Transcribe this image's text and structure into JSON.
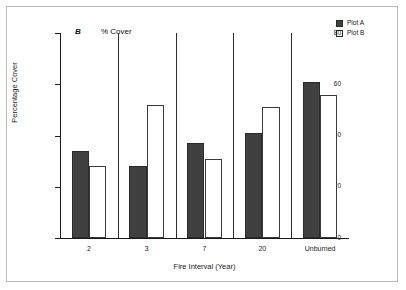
{
  "chart_data": {
    "type": "bar",
    "title": "",
    "panel_label": "B",
    "subtitle": "% Cover",
    "xlabel": "Fire Interval (Year)",
    "ylabel": "Percentage Cover",
    "categories": [
      "2",
      "3",
      "7",
      "20",
      "Unburned"
    ],
    "series": [
      {
        "name": "Plot A",
        "color": "#404040",
        "values": [
          34,
          28,
          37,
          41,
          61
        ]
      },
      {
        "name": "Plot B",
        "color": "#ffffff",
        "values": [
          28,
          52,
          31,
          51,
          56
        ]
      }
    ],
    "ylim": [
      0,
      80
    ],
    "yticks": [
      0,
      20,
      40,
      60,
      80
    ],
    "ytick_labels": [
      "0",
      "20",
      "40",
      "60",
      "80"
    ],
    "grid": false,
    "legend_position": "top-right"
  },
  "legend": {
    "items": [
      {
        "label": "Plot A",
        "style": "filled"
      },
      {
        "label": "Plot B",
        "style": "open"
      }
    ]
  },
  "axes": {
    "y_title": "Percentage Cover",
    "x_title": "Fire Interval (Year)",
    "y_tick_0": "0",
    "y_tick_1": "20",
    "y_tick_2": "40",
    "y_tick_3": "60",
    "y_tick_4": "80"
  },
  "annotations": {
    "panel": "B",
    "measure": "% Cover"
  }
}
